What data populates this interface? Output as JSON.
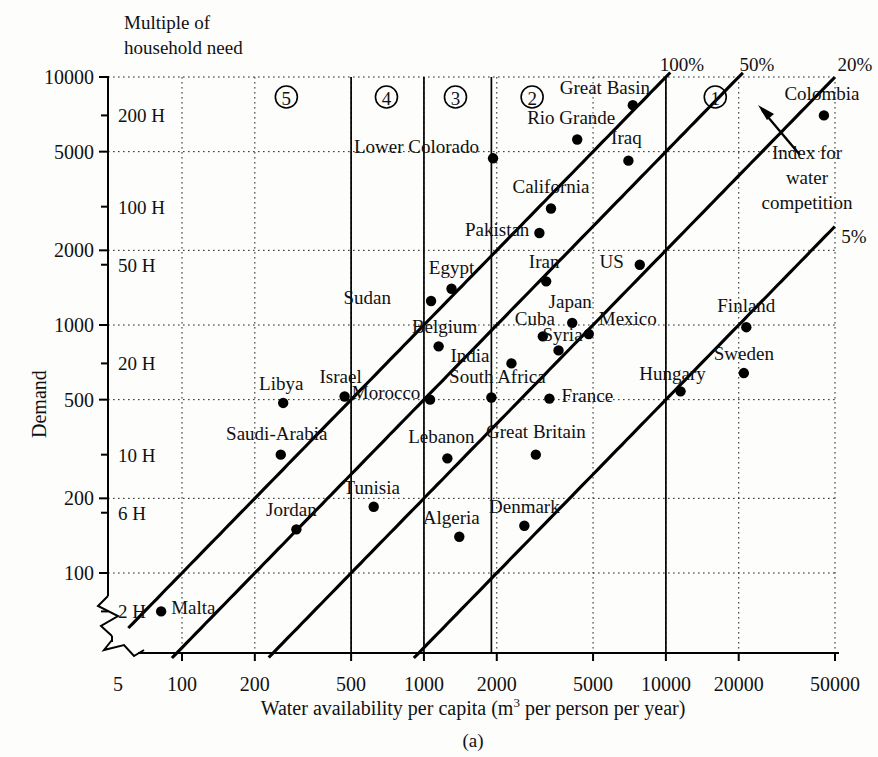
{
  "figure": {
    "label": "(a)",
    "header_note_line1": "Multiple of",
    "header_note_line2": "household need",
    "xlabel_pre": "Water availability per capita (m",
    "xlabel_sup": "3",
    "xlabel_post": " per person per year)",
    "ylabel": "Demand"
  },
  "annotation": {
    "index_line1": "Index for",
    "index_line2": "water",
    "index_line3": "competition"
  },
  "chart_data": {
    "type": "scatter",
    "title": "",
    "xlabel": "Water availability per capita (m3 per person per year)",
    "ylabel": "Demand",
    "xscale": "log",
    "yscale": "log",
    "xlim": [
      70,
      50000
    ],
    "ylim": [
      60,
      10000
    ],
    "grid": true,
    "legend": "none",
    "xticks": [
      "5",
      "100",
      "200",
      "500",
      "1000",
      "2000",
      "5000",
      "10000",
      "20000",
      "50000"
    ],
    "xtick_values": [
      70,
      100,
      200,
      500,
      1000,
      2000,
      5000,
      10000,
      20000,
      50000
    ],
    "yticks": [
      "100",
      "200",
      "500",
      "1000",
      "2000",
      "5000",
      "10000"
    ],
    "ytick_values": [
      100,
      200,
      500,
      1000,
      2000,
      5000,
      10000
    ],
    "secondary_y_labels": [
      "2 H",
      "6 H",
      "10 H",
      "20 H",
      "50 H",
      "100 H",
      "200 H"
    ],
    "secondary_y_values": [
      70,
      175,
      300,
      700,
      1750,
      3000,
      7000
    ],
    "competition_lines": [
      {
        "label": "100%",
        "ratio": 1.0
      },
      {
        "label": "50%",
        "ratio": 0.5
      },
      {
        "label": "20%",
        "ratio": 0.2
      },
      {
        "label": "5%",
        "ratio": 0.05
      }
    ],
    "zone_markers": [
      {
        "label": "5",
        "x": 270
      },
      {
        "label": "4",
        "x": 700
      },
      {
        "label": "3",
        "x": 1350
      },
      {
        "label": "2",
        "x": 2800
      },
      {
        "label": "1",
        "x": 16000
      }
    ],
    "zone_boundaries": [
      500,
      1000,
      1900,
      10000
    ],
    "points": [
      {
        "name": "Malta",
        "x": 82,
        "y": 70,
        "label_dx": 10,
        "label_dy": -4,
        "anchor": "start"
      },
      {
        "name": "Jordan",
        "x": 297,
        "y": 150,
        "label_dx": -5,
        "label_dy": -20,
        "anchor": "middle"
      },
      {
        "name": "Saudi-Arabia",
        "x": 256,
        "y": 300,
        "label_dx": -4,
        "label_dy": -22,
        "anchor": "middle"
      },
      {
        "name": "Libya",
        "x": 262,
        "y": 485,
        "label_dx": -2,
        "label_dy": -20,
        "anchor": "middle"
      },
      {
        "name": "Israel",
        "x": 470,
        "y": 515,
        "label_dx": -4,
        "label_dy": -20,
        "anchor": "middle"
      },
      {
        "name": "Tunisia",
        "x": 620,
        "y": 185,
        "label_dx": -2,
        "label_dy": -20,
        "anchor": "middle"
      },
      {
        "name": "Morocco",
        "x": 1060,
        "y": 500,
        "label_dx": -44,
        "label_dy": -8,
        "anchor": "middle"
      },
      {
        "name": "Sudan",
        "x": 1070,
        "y": 1250,
        "label_dx": -40,
        "label_dy": -4,
        "anchor": "end"
      },
      {
        "name": "Belgium",
        "x": 1150,
        "y": 820,
        "label_dx": 6,
        "label_dy": -20,
        "anchor": "middle"
      },
      {
        "name": "Lebanon",
        "x": 1250,
        "y": 290,
        "label_dx": -6,
        "label_dy": -22,
        "anchor": "middle"
      },
      {
        "name": "Egypt",
        "x": 1300,
        "y": 1400,
        "label_dx": 0,
        "label_dy": -22,
        "anchor": "middle"
      },
      {
        "name": "Algeria",
        "x": 1400,
        "y": 140,
        "label_dx": -8,
        "label_dy": -20,
        "anchor": "middle"
      },
      {
        "name": "South Africa",
        "x": 1900,
        "y": 510,
        "label_dx": 6,
        "label_dy": -22,
        "anchor": "middle"
      },
      {
        "name": "Lower Colorado",
        "x": 1930,
        "y": 4700,
        "label_dx": -14,
        "label_dy": -12,
        "anchor": "end"
      },
      {
        "name": "India",
        "x": 2300,
        "y": 700,
        "label_dx": -22,
        "label_dy": -8,
        "anchor": "end"
      },
      {
        "name": "Denmark",
        "x": 2600,
        "y": 155,
        "label_dx": 0,
        "label_dy": -20,
        "anchor": "middle"
      },
      {
        "name": "Great Britain",
        "x": 2900,
        "y": 300,
        "label_dx": 0,
        "label_dy": -24,
        "anchor": "middle"
      },
      {
        "name": "Pakistan",
        "x": 3000,
        "y": 2350,
        "label_dx": -10,
        "label_dy": -4,
        "anchor": "end"
      },
      {
        "name": "Cuba",
        "x": 3100,
        "y": 900,
        "label_dx": -8,
        "label_dy": -18,
        "anchor": "middle"
      },
      {
        "name": "Iran",
        "x": 3200,
        "y": 1500,
        "label_dx": -2,
        "label_dy": -20,
        "anchor": "middle"
      },
      {
        "name": "California",
        "x": 3350,
        "y": 2950,
        "label_dx": 0,
        "label_dy": -22,
        "anchor": "middle"
      },
      {
        "name": "France",
        "x": 3300,
        "y": 505,
        "label_dx": 12,
        "label_dy": -4,
        "anchor": "start"
      },
      {
        "name": "Syria",
        "x": 3600,
        "y": 790,
        "label_dx": 4,
        "label_dy": -16,
        "anchor": "middle"
      },
      {
        "name": "Rio Grande",
        "x": 4300,
        "y": 5600,
        "label_dx": -6,
        "label_dy": -22,
        "anchor": "middle"
      },
      {
        "name": "Japan",
        "x": 4100,
        "y": 1020,
        "label_dx": -2,
        "label_dy": -22,
        "anchor": "middle"
      },
      {
        "name": "Mexico",
        "x": 4800,
        "y": 920,
        "label_dx": 10,
        "label_dy": -16,
        "anchor": "start"
      },
      {
        "name": "Great Basin",
        "x": 7300,
        "y": 7700,
        "label_dx": -28,
        "label_dy": -18,
        "anchor": "middle"
      },
      {
        "name": "Iraq",
        "x": 7000,
        "y": 4600,
        "label_dx": -2,
        "label_dy": -24,
        "anchor": "middle"
      },
      {
        "name": "US",
        "x": 7800,
        "y": 1750,
        "label_dx": -16,
        "label_dy": -4,
        "anchor": "end"
      },
      {
        "name": "Hungary",
        "x": 11500,
        "y": 540,
        "label_dx": -8,
        "label_dy": -18,
        "anchor": "middle"
      },
      {
        "name": "Sweden",
        "x": 21000,
        "y": 640,
        "label_dx": 0,
        "label_dy": -20,
        "anchor": "middle"
      },
      {
        "name": "Finland",
        "x": 21500,
        "y": 980,
        "label_dx": 0,
        "label_dy": -22,
        "anchor": "middle"
      },
      {
        "name": "Colombia",
        "x": 45000,
        "y": 7000,
        "label_dx": -2,
        "label_dy": -22,
        "anchor": "middle"
      }
    ]
  }
}
